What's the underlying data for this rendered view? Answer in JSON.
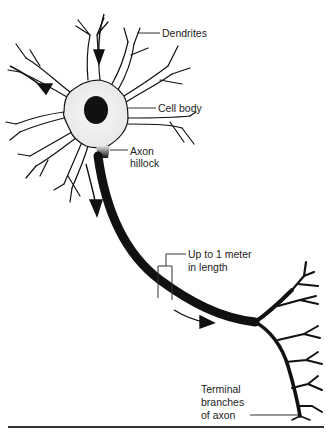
{
  "diagram": {
    "labels": {
      "dendrites": "Dendrites",
      "cell_body": "Cell body",
      "axon_hillock_line1": "Axon",
      "axon_hillock_line2": "hillock",
      "length_line1": "Up to 1 meter",
      "length_line2": "in length",
      "terminal_line1": "Terminal",
      "terminal_line2": "branches",
      "terminal_line3": "of axon"
    },
    "colors": {
      "ink": "#111111",
      "cell_fill": "#f2f2f2",
      "nucleus": "#111111",
      "text": "#222222"
    }
  }
}
